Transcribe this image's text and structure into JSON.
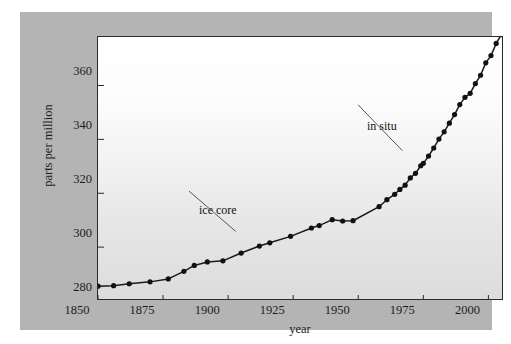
{
  "figure": {
    "panel_color": "#b4b4b4",
    "frame_color": "#2b2b2b",
    "line_color": "#1a1a1a",
    "marker_color": "#111111"
  },
  "chart_data": {
    "type": "line",
    "title": "",
    "subtitle": "",
    "xlabel": "year",
    "ylabel": "parts per million",
    "xlim": [
      1850,
      2006
    ],
    "ylim": [
      280,
      378
    ],
    "xticks": [
      1850,
      1875,
      1900,
      1925,
      1950,
      1975,
      2000
    ],
    "xtick_labels": [
      "1850",
      "1875",
      "1900",
      "1925",
      "1950",
      "1975",
      "2000"
    ],
    "yticks": [
      280,
      300,
      320,
      340,
      360
    ],
    "ytick_labels": [
      "280",
      "300",
      "320",
      "340",
      "360"
    ],
    "grid": false,
    "legend": "none",
    "annotations": [
      {
        "name": "ice-core",
        "label": "ice core",
        "text_x": 1893,
        "text_y": 316,
        "point_x": 1911,
        "point_y": 301
      },
      {
        "name": "in-situ",
        "label": "in situ",
        "text_x": 1958,
        "text_y": 348,
        "point_x": 1975,
        "point_y": 331
      }
    ],
    "series": [
      {
        "name": "ice core",
        "marker": "filled-circle",
        "x": [
          1850,
          1856,
          1862,
          1870,
          1877,
          1883,
          1887,
          1892,
          1898,
          1905,
          1912,
          1916,
          1924,
          1932,
          1935,
          1940,
          1944,
          1948
        ],
        "values": [
          285.5,
          285.7,
          286.4,
          287.1,
          288.2,
          291.0,
          293.2,
          294.5,
          294.9,
          297.8,
          300.4,
          301.6,
          304.0,
          307.1,
          308.0,
          310.2,
          309.7,
          309.8
        ]
      },
      {
        "name": "in situ",
        "marker": "filled-circle",
        "x": [
          1958,
          1961,
          1964,
          1966,
          1968,
          1970,
          1972,
          1974,
          1975,
          1977,
          1979,
          1981,
          1983,
          1985,
          1987,
          1989,
          1991,
          1993,
          1995,
          1997,
          1999,
          2001,
          2003,
          2005,
          2006
        ],
        "values": [
          315.0,
          317.6,
          319.6,
          321.4,
          323.0,
          325.7,
          327.4,
          330.2,
          331.1,
          333.8,
          336.8,
          340.1,
          342.8,
          346.0,
          349.2,
          352.9,
          355.6,
          357.1,
          360.7,
          363.8,
          368.4,
          371.1,
          375.6,
          378.9,
          380.6
        ]
      }
    ]
  }
}
